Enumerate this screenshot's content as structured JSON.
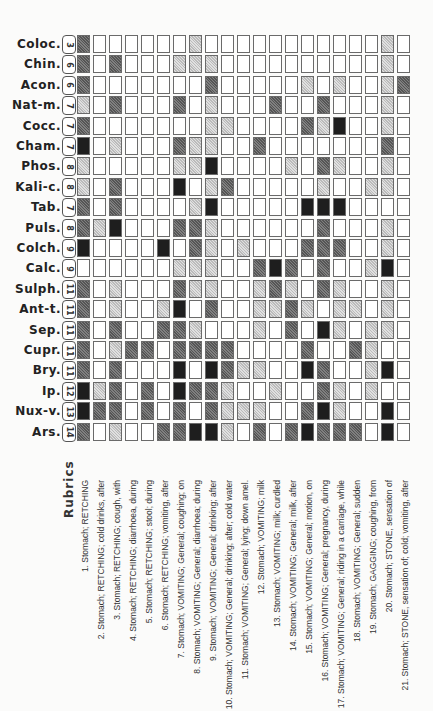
{
  "title": "Rubrics",
  "columns": 21,
  "remedies": [
    {
      "name": "Coloc.",
      "count": "3",
      "grades": [
        2,
        0,
        0,
        0,
        0,
        0,
        0,
        1,
        0,
        0,
        0,
        0,
        0,
        0,
        0,
        0,
        0,
        0,
        0,
        1,
        0
      ]
    },
    {
      "name": "Chin.",
      "count": "6",
      "grades": [
        2,
        0,
        2,
        0,
        0,
        0,
        1,
        1,
        1,
        0,
        0,
        0,
        0,
        0,
        0,
        0,
        0,
        0,
        0,
        1,
        0
      ]
    },
    {
      "name": "Acon.",
      "count": "6",
      "grades": [
        2,
        0,
        0,
        0,
        0,
        0,
        0,
        0,
        2,
        0,
        0,
        0,
        0,
        0,
        1,
        0,
        1,
        0,
        0,
        1,
        2
      ]
    },
    {
      "name": "Nat-m.",
      "count": "7",
      "grades": [
        1,
        0,
        2,
        0,
        0,
        0,
        2,
        0,
        1,
        0,
        0,
        0,
        2,
        0,
        0,
        2,
        0,
        0,
        0,
        1,
        0
      ]
    },
    {
      "name": "Cocc.",
      "count": "7",
      "grades": [
        2,
        0,
        0,
        0,
        0,
        0,
        0,
        0,
        1,
        1,
        0,
        0,
        0,
        0,
        2,
        1,
        3,
        0,
        0,
        1,
        0
      ]
    },
    {
      "name": "Cham.",
      "count": "7",
      "grades": [
        3,
        0,
        1,
        0,
        0,
        0,
        2,
        1,
        1,
        0,
        0,
        2,
        0,
        0,
        0,
        0,
        0,
        0,
        0,
        2,
        0
      ]
    },
    {
      "name": "Phos.",
      "count": "8",
      "grades": [
        1,
        0,
        0,
        0,
        0,
        0,
        1,
        1,
        3,
        0,
        0,
        0,
        0,
        1,
        0,
        2,
        1,
        0,
        0,
        1,
        0
      ]
    },
    {
      "name": "Kali-c.",
      "count": "8",
      "grades": [
        1,
        0,
        2,
        0,
        0,
        0,
        3,
        0,
        1,
        2,
        0,
        0,
        0,
        0,
        0,
        1,
        0,
        0,
        1,
        1,
        0
      ]
    },
    {
      "name": "Tab.",
      "count": "7",
      "grades": [
        2,
        0,
        2,
        0,
        0,
        0,
        0,
        1,
        3,
        0,
        0,
        0,
        0,
        0,
        3,
        3,
        3,
        0,
        0,
        0,
        0
      ]
    },
    {
      "name": "Puls.",
      "count": "8",
      "grades": [
        2,
        1,
        3,
        0,
        0,
        0,
        2,
        2,
        1,
        0,
        0,
        0,
        0,
        0,
        0,
        2,
        0,
        0,
        0,
        1,
        0
      ]
    },
    {
      "name": "Colch.",
      "count": "9",
      "grades": [
        3,
        0,
        0,
        0,
        0,
        3,
        0,
        2,
        1,
        0,
        1,
        0,
        0,
        0,
        2,
        2,
        2,
        0,
        0,
        1,
        0
      ]
    },
    {
      "name": "Calc.",
      "count": "9",
      "grades": [
        0,
        0,
        0,
        0,
        0,
        0,
        1,
        1,
        1,
        0,
        0,
        2,
        3,
        2,
        0,
        2,
        0,
        0,
        1,
        3,
        0
      ]
    },
    {
      "name": "Sulph.",
      "count": "11",
      "grades": [
        2,
        0,
        1,
        0,
        0,
        0,
        2,
        1,
        1,
        0,
        0,
        1,
        2,
        1,
        0,
        2,
        1,
        0,
        0,
        1,
        0
      ]
    },
    {
      "name": "Ant-t.",
      "count": "11",
      "grades": [
        2,
        0,
        1,
        0,
        0,
        1,
        3,
        0,
        2,
        0,
        0,
        1,
        1,
        2,
        1,
        0,
        1,
        1,
        0,
        1,
        0
      ]
    },
    {
      "name": "Sep.",
      "count": "11",
      "grades": [
        2,
        0,
        2,
        0,
        0,
        2,
        2,
        1,
        0,
        0,
        0,
        1,
        0,
        2,
        0,
        3,
        1,
        0,
        1,
        1,
        0
      ]
    },
    {
      "name": "Cupr.",
      "count": "11",
      "grades": [
        2,
        0,
        1,
        2,
        2,
        0,
        2,
        2,
        2,
        2,
        0,
        0,
        0,
        0,
        2,
        0,
        0,
        2,
        1,
        0,
        0
      ]
    },
    {
      "name": "Bry.",
      "count": "11",
      "grades": [
        2,
        0,
        2,
        0,
        0,
        0,
        3,
        0,
        3,
        2,
        1,
        1,
        0,
        0,
        3,
        2,
        0,
        0,
        1,
        3,
        0
      ]
    },
    {
      "name": "Ip.",
      "count": "12",
      "grades": [
        3,
        1,
        2,
        0,
        2,
        0,
        3,
        2,
        2,
        1,
        0,
        0,
        1,
        0,
        0,
        2,
        1,
        0,
        1,
        0,
        0
      ]
    },
    {
      "name": "Nux-v.",
      "count": "13",
      "grades": [
        3,
        2,
        2,
        0,
        2,
        0,
        2,
        0,
        2,
        1,
        1,
        1,
        0,
        0,
        2,
        3,
        1,
        0,
        0,
        3,
        0
      ]
    },
    {
      "name": "Ars.",
      "count": "14",
      "grades": [
        2,
        0,
        1,
        0,
        0,
        2,
        2,
        3,
        3,
        1,
        0,
        2,
        0,
        2,
        3,
        2,
        2,
        2,
        0,
        3,
        0
      ]
    }
  ],
  "rubrics": [
    "1. Stomach; RETCHING",
    "2. Stomach; RETCHING; cold drinks, after",
    "3. Stomach; RETCHING; cough, with",
    "4. Stomach; RETCHING; diarrhoea, during",
    "5. Stomach; RETCHING; stool; during",
    "6. Stomach; RETCHING; vomiting, after",
    "7. Stomach; VOMITING; General; coughing; on",
    "8. Stomach; VOMITING; General; diarrhoea; during",
    "9. Stomach; VOMITING; General; drinking; after",
    "10. Stomach; VOMITING; General; drinking; after; cold water",
    "11. Stomach; VOMITING; General; lying; down amel.",
    "12. Stomach; VOMITING; milk",
    "13. Stomach; VOMITING; milk; curdled",
    "14. Stomach; VOMITING; General; milk, after",
    "15. Stomach; VOMITING; General; motion, on",
    "16. Stomach; VOMITING; General; pregnancy, during",
    "17. Stomach; VOMITING; General; riding in a carriage, while",
    "18. Stomach; VOMITING; General; sudden",
    "19. Stomach; GAGGING; coughing, from",
    "20. Stomach; STONE, sensation of",
    "21. Stomach; STONE, sensation of; cold; vomiting, after"
  ],
  "colors": {
    "grade0": "#ffffff",
    "grade1": "#cfcfcf",
    "grade2": "#6a6a6a",
    "grade3": "#1e1e1e"
  }
}
